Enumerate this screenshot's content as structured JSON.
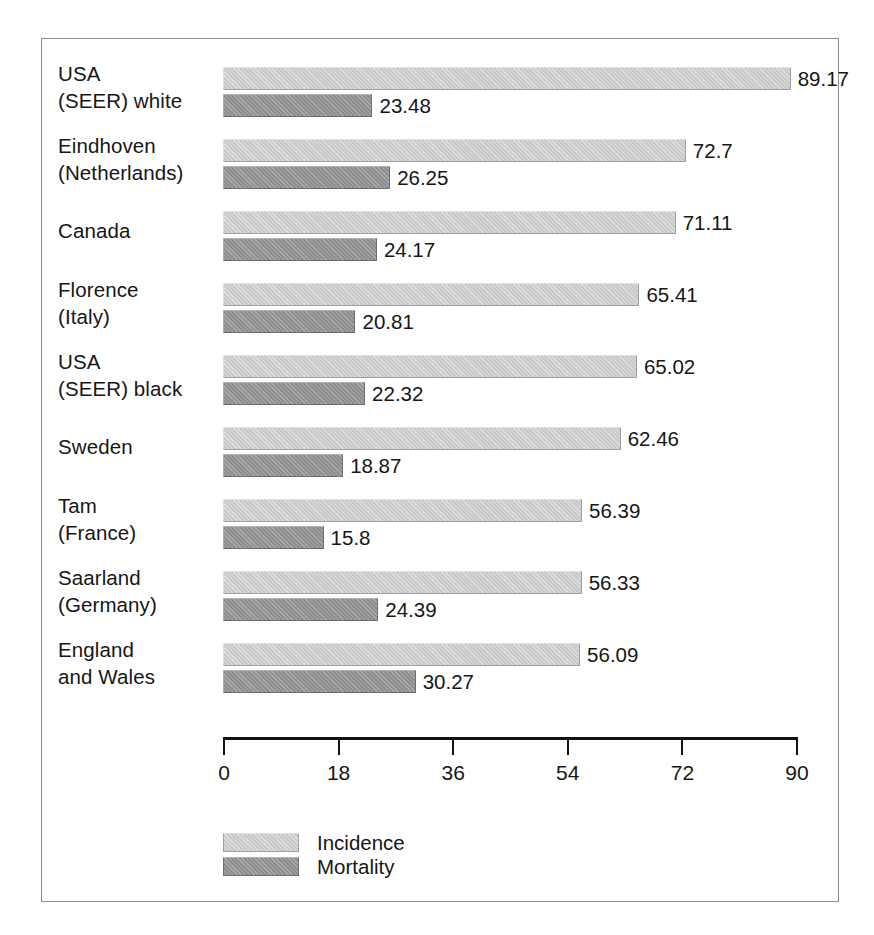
{
  "chart_data": {
    "type": "bar",
    "orientation": "horizontal",
    "title": "",
    "xlabel": "",
    "ylabel": "",
    "xlim": [
      0,
      90
    ],
    "xticks": [
      0,
      18,
      36,
      54,
      72,
      90
    ],
    "tick_labels": [
      "0",
      "18",
      "36",
      "54",
      "72",
      "90"
    ],
    "grid": false,
    "legend_position": "bottom-left",
    "categories": [
      "USA\n(SEER) white",
      "Eindhoven\n(Netherlands)",
      "Canada",
      "Florence\n(Italy)",
      "USA\n(SEER) black",
      "Sweden",
      "Tam\n(France)",
      "Saarland\n(Germany)",
      "England\nand Wales"
    ],
    "series": [
      {
        "name": "Incidence",
        "color": "#c9c9c9",
        "values": [
          89.17,
          72.7,
          71.11,
          65.41,
          65.02,
          62.46,
          56.39,
          56.33,
          56.09
        ],
        "value_labels": [
          "89.17",
          "72.7",
          "71.11",
          "65.41",
          "65.02",
          "62.46",
          "56.39",
          "56.33",
          "56.09"
        ]
      },
      {
        "name": "Mortality",
        "color": "#8e8e8e",
        "values": [
          23.48,
          26.25,
          24.17,
          20.81,
          22.32,
          18.87,
          15.8,
          24.39,
          30.27
        ],
        "value_labels": [
          "23.48",
          "26.25",
          "24.17",
          "20.81",
          "22.32",
          "18.87",
          "15.8",
          "24.39",
          "30.27"
        ]
      }
    ]
  },
  "legend": {
    "items": [
      {
        "label": "Incidence",
        "key": "incidence"
      },
      {
        "label": "Mortality",
        "key": "mortality"
      }
    ]
  }
}
